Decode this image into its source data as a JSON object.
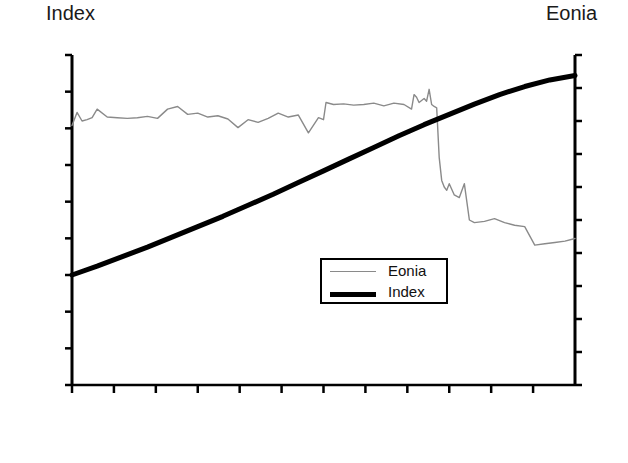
{
  "chart_data": {
    "type": "line",
    "title": "",
    "xlabel": "",
    "left_axis": {
      "label": "Index",
      "ylim": [
        98.5,
        103.0
      ],
      "ticks": [
        "98.5",
        "99.0",
        "99.5",
        "100.0",
        "100.5",
        "101.0",
        "101.5",
        "102.0",
        "102.5",
        "103.0"
      ],
      "tick_values": [
        98.5,
        99.0,
        99.5,
        100.0,
        100.5,
        101.0,
        101.5,
        102.0,
        102.5,
        103.0
      ]
    },
    "right_axis": {
      "label": "Eonia",
      "ylim": [
        0.0,
        5.0
      ],
      "ticks": [
        "0.00",
        "0.50",
        "1.00",
        "1.50",
        "2.00",
        "2.50",
        "3.00",
        "3.50",
        "4.00",
        "4.50",
        "5.00"
      ],
      "tick_values": [
        0.0,
        0.5,
        1.0,
        1.5,
        2.0,
        2.5,
        3.0,
        3.5,
        4.0,
        4.5,
        5.0
      ]
    },
    "categories": [
      "Jan 08",
      "Feb 08",
      "Mar 08",
      "Apr 08",
      "May 08",
      "Jun 08",
      "Jul 08",
      "Aug 08",
      "Sep 08",
      "Oct 08",
      "Nov 08",
      "Dec 08"
    ],
    "grid": false,
    "legend_position": "center-right",
    "series": [
      {
        "name": "Eonia",
        "axis": "right",
        "color": "#8a8a8a",
        "style": "thin",
        "x": [
          0.0,
          0.01,
          0.02,
          0.03,
          0.04,
          0.05,
          0.07,
          0.09,
          0.11,
          0.13,
          0.15,
          0.17,
          0.19,
          0.21,
          0.23,
          0.25,
          0.27,
          0.29,
          0.31,
          0.33,
          0.35,
          0.37,
          0.39,
          0.41,
          0.43,
          0.45,
          0.47,
          0.49,
          0.5,
          0.505,
          0.52,
          0.54,
          0.56,
          0.58,
          0.6,
          0.62,
          0.64,
          0.66,
          0.675,
          0.68,
          0.685,
          0.69,
          0.7,
          0.705,
          0.71,
          0.715,
          0.72,
          0.725,
          0.73,
          0.735,
          0.74,
          0.745,
          0.75,
          0.76,
          0.77,
          0.78,
          0.79,
          0.8,
          0.82,
          0.84,
          0.86,
          0.88,
          0.9,
          0.92,
          0.94,
          0.96,
          0.98,
          1.0
        ],
        "values": [
          3.93,
          4.13,
          4.0,
          4.02,
          4.05,
          4.18,
          4.06,
          4.05,
          4.04,
          4.05,
          4.07,
          4.04,
          4.18,
          4.22,
          4.1,
          4.12,
          4.06,
          4.08,
          4.03,
          3.9,
          4.02,
          3.98,
          4.04,
          4.12,
          4.06,
          4.09,
          3.82,
          4.05,
          4.02,
          4.28,
          4.25,
          4.26,
          4.24,
          4.25,
          4.27,
          4.23,
          4.27,
          4.25,
          4.18,
          4.4,
          4.36,
          4.28,
          4.34,
          4.3,
          4.48,
          4.25,
          4.22,
          4.2,
          3.45,
          3.1,
          3.0,
          2.95,
          3.05,
          2.88,
          2.84,
          3.05,
          2.5,
          2.46,
          2.48,
          2.52,
          2.46,
          2.42,
          2.4,
          2.12,
          2.14,
          2.16,
          2.18,
          2.22
        ]
      },
      {
        "name": "Index",
        "axis": "left",
        "color": "#000000",
        "style": "thick",
        "x": [
          0.0,
          0.05,
          0.1,
          0.15,
          0.2,
          0.25,
          0.3,
          0.35,
          0.4,
          0.45,
          0.5,
          0.55,
          0.6,
          0.65,
          0.7,
          0.75,
          0.8,
          0.85,
          0.9,
          0.95,
          1.0
        ],
        "values": [
          100.0,
          100.12,
          100.25,
          100.38,
          100.52,
          100.66,
          100.8,
          100.95,
          101.1,
          101.26,
          101.42,
          101.58,
          101.74,
          101.9,
          102.05,
          102.19,
          102.33,
          102.46,
          102.57,
          102.66,
          102.72
        ]
      }
    ],
    "legend": [
      {
        "label": "Eonia",
        "style": "thin"
      },
      {
        "label": "Index",
        "style": "thick"
      }
    ]
  },
  "colors": {
    "eonia_line": "#8a8a8a",
    "index_line": "#000000",
    "axis": "#000000",
    "background": "#ffffff"
  }
}
